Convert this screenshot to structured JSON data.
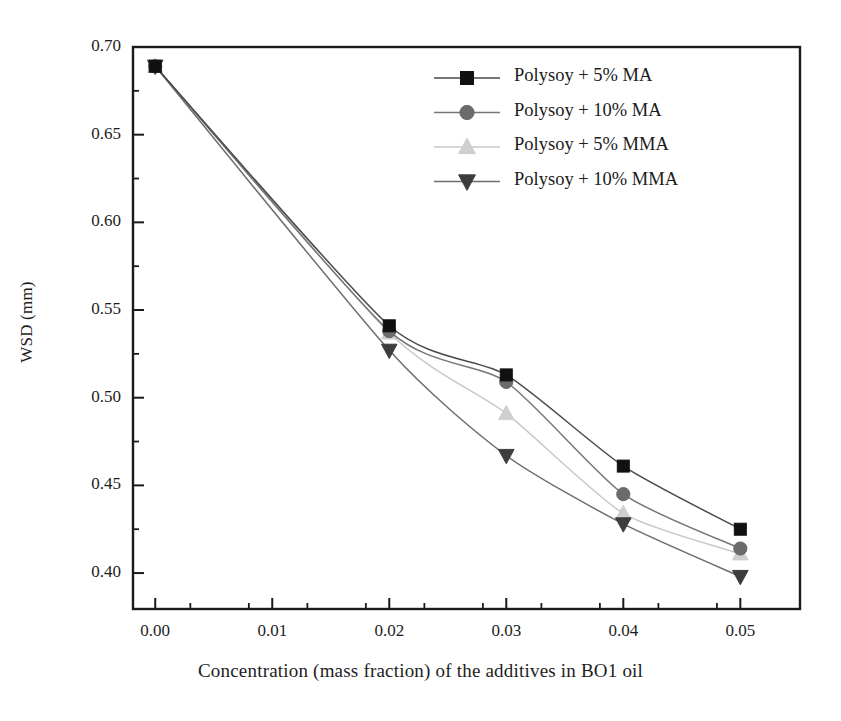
{
  "chart_data": {
    "type": "line",
    "title": "",
    "xlabel": "Concentration (mass fraction) of the additives in BO1 oil",
    "ylabel": "WSD (mm)",
    "x": [
      0.0,
      0.02,
      0.03,
      0.04,
      0.05
    ],
    "xlim": [
      -0.0019,
      0.0551
    ],
    "ylim": [
      0.3795,
      0.7
    ],
    "xticks": [
      "0.00",
      "0.01",
      "0.02",
      "0.03",
      "0.04",
      "0.05"
    ],
    "xtick_values": [
      0.0,
      0.01,
      0.02,
      0.03,
      0.04,
      0.05
    ],
    "xminor_step": 0.005,
    "yticks": [
      "0.40",
      "0.45",
      "0.50",
      "0.55",
      "0.60",
      "0.65",
      "0.70"
    ],
    "ytick_values": [
      0.4,
      0.45,
      0.5,
      0.55,
      0.6,
      0.65,
      0.7
    ],
    "yminor_step": 0.025,
    "grid": false,
    "legend_position": "upper-right-inside",
    "series": [
      {
        "name": "Polysoy + 5% MA",
        "marker": "square",
        "color": "#111111",
        "line_color": "#4a4a4a",
        "values": [
          0.689,
          0.541,
          0.513,
          0.461,
          0.425
        ]
      },
      {
        "name": "Polysoy + 10% MA",
        "marker": "circle",
        "color": "#6b6b6b",
        "line_color": "#767676",
        "values": [
          0.689,
          0.538,
          0.509,
          0.445,
          0.414
        ]
      },
      {
        "name": "Polysoy + 5% MMA",
        "marker": "triangle-up",
        "color": "#cfcfcf",
        "line_color": "#c8c8c8",
        "values": [
          0.689,
          0.537,
          0.491,
          0.434,
          0.411
        ]
      },
      {
        "name": "Polysoy + 10% MMA",
        "marker": "triangle-down",
        "color": "#3d3d3d",
        "line_color": "#6e6e6e",
        "values": [
          0.689,
          0.527,
          0.467,
          0.428,
          0.398
        ]
      }
    ]
  },
  "legend": {
    "entries": [
      {
        "label": "Polysoy + 5% MA"
      },
      {
        "label": "Polysoy + 10% MA"
      },
      {
        "label": "Polysoy + 5% MMA"
      },
      {
        "label": "Polysoy + 10% MMA"
      }
    ]
  },
  "frame": {
    "color": "#1a1a1a"
  }
}
